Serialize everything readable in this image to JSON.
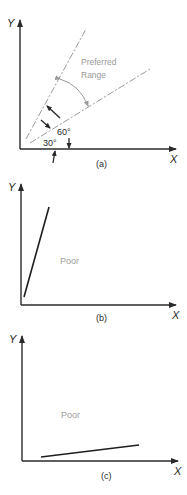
{
  "colors": {
    "axis": "#2a2a2a",
    "line": "#1e1e1e",
    "guide": "#9a9a9a",
    "range_text": "#9a9a9a",
    "poor_text": "#a0a0a0"
  },
  "panels": [
    {
      "id": "a",
      "caption": "(a)",
      "x_axis_label": "X",
      "y_axis_label": "Y",
      "region_label_line1": "Preferred",
      "region_label_line2": "Range",
      "angle_upper": "60°",
      "angle_lower": "30°"
    },
    {
      "id": "b",
      "caption": "(b)",
      "x_axis_label": "X",
      "y_axis_label": "Y",
      "region_label": "Poor"
    },
    {
      "id": "c",
      "caption": "(c)",
      "x_axis_label": "X",
      "y_axis_label": "Y",
      "region_label": "Poor"
    }
  ]
}
